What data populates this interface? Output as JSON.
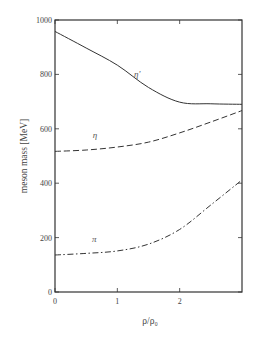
{
  "chart_data": {
    "type": "line",
    "title": "",
    "xlabel": "ρ/ρ₀",
    "ylabel": "meson mass [MeV]",
    "xlim": [
      0,
      3
    ],
    "ylim": [
      0,
      1000
    ],
    "x_ticks": [
      0,
      1,
      2
    ],
    "x_tick_labels": [
      "0",
      "1",
      "2"
    ],
    "y_ticks": [
      0,
      200,
      400,
      600,
      800,
      1000
    ],
    "y_tick_labels": [
      "0",
      "200",
      "400",
      "600",
      "800",
      "1000"
    ],
    "grid": false,
    "legend": "none (inline curve labels)",
    "x": [
      0,
      0.5,
      1.0,
      1.5,
      2.0,
      2.5,
      3.0
    ],
    "series": [
      {
        "name": "η'",
        "style": "solid",
        "values": [
          958,
          897,
          834,
          752,
          698,
          692,
          690
        ],
        "label_pos": [
          1.32,
          790
        ]
      },
      {
        "name": "η",
        "style": "dashed",
        "values": [
          517,
          522,
          533,
          551,
          585,
          625,
          667
        ],
        "label_pos": [
          0.64,
          565
        ]
      },
      {
        "name": "π",
        "style": "dash-dot",
        "values": [
          136,
          142,
          151,
          176,
          230,
          320,
          412
        ],
        "label_pos": [
          0.63,
          182
        ]
      }
    ]
  }
}
